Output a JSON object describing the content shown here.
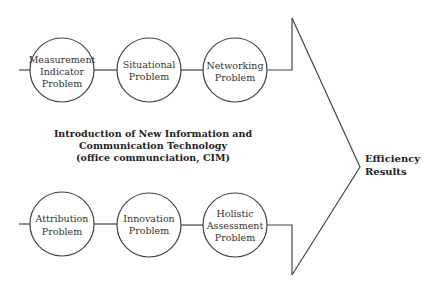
{
  "diagram": {
    "top_row": [
      {
        "lines": [
          "Measurement",
          "Indicator",
          "Problem"
        ]
      },
      {
        "lines": [
          "Situational",
          "Problem"
        ]
      },
      {
        "lines": [
          "Networking",
          "Problem"
        ]
      }
    ],
    "bottom_row": [
      {
        "lines": [
          "Attribution",
          "Problem"
        ]
      },
      {
        "lines": [
          "Innovation",
          "Problem"
        ]
      },
      {
        "lines": [
          "Holistic",
          "Assessment",
          "Problem"
        ]
      }
    ],
    "center_text": [
      "Introduction of New Information and",
      "Communication Technology",
      "(office communciation, CIM)"
    ],
    "result_text": [
      "Efficiency",
      "Results"
    ],
    "colors": {
      "stroke": "#444444",
      "text": "#333333",
      "background": "#ffffff"
    }
  }
}
